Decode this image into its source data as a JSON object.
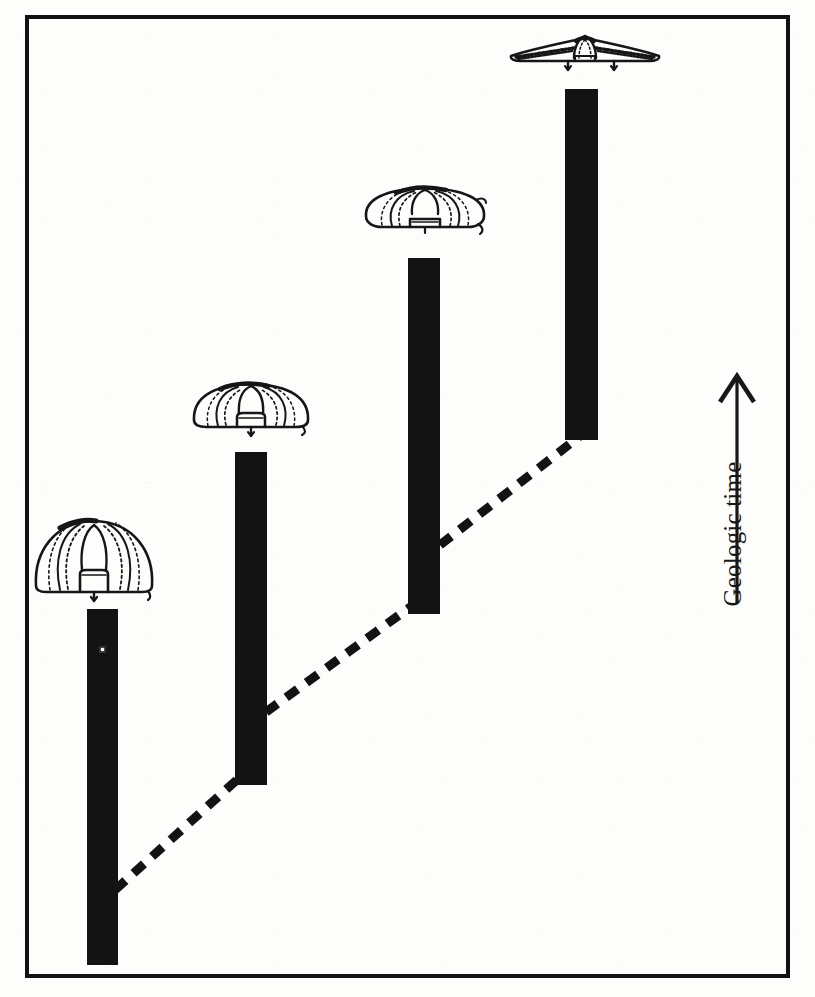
{
  "figure": {
    "domain_kind": "paleontology-range-chart",
    "caption_absent": true,
    "background_color": "#fdfdfb",
    "ink_color": "#131313",
    "frame": {
      "x": 25,
      "y": 15,
      "width": 765,
      "height": 963,
      "border_width": 4,
      "border_color": "#121212"
    }
  },
  "axis": {
    "time": {
      "label": "Geologic time",
      "direction": "upward",
      "arrow_icon": "up-arrow-icon",
      "orientation_degrees": -90,
      "x": 700,
      "y": 370
    }
  },
  "chart_data": {
    "type": "bar",
    "title": "",
    "subtitle": "",
    "xlabel": "",
    "ylabel": "Geologic time",
    "grid": false,
    "legend_position": "none",
    "orientation": "vertical",
    "axis_direction": "time increases upward",
    "categories": [
      "Taxon 1",
      "Taxon 2",
      "Taxon 3",
      "Taxon 4"
    ],
    "values": [
      356,
      333,
      356,
      351
    ],
    "bars": [
      {
        "index": 1,
        "name": "Taxon 1",
        "x": 87,
        "y": 609,
        "width": 31,
        "height": 356,
        "top_y": 609,
        "bottom_y": 965,
        "color": "#131313",
        "has_speck": true,
        "speck": {
          "x": 99,
          "y": 646,
          "shape": "white-ring"
        }
      },
      {
        "index": 2,
        "name": "Taxon 2",
        "x": 235,
        "y": 452,
        "width": 32,
        "height": 333,
        "top_y": 452,
        "bottom_y": 785,
        "color": "#131313",
        "has_speck": false
      },
      {
        "index": 3,
        "name": "Taxon 3",
        "x": 408,
        "y": 258,
        "width": 32,
        "height": 356,
        "top_y": 258,
        "bottom_y": 614,
        "color": "#131313",
        "has_speck": false
      },
      {
        "index": 4,
        "name": "Taxon 4",
        "x": 565,
        "y": 89,
        "width": 33,
        "height": 351,
        "top_y": 89,
        "bottom_y": 440,
        "color": "#131313",
        "has_speck": false
      }
    ],
    "lineage_line": {
      "style": "dashed",
      "dash_pattern": "14 11",
      "stroke_width": 9,
      "color": "#131313",
      "points": [
        {
          "x": 115,
          "y": 890
        },
        {
          "x": 250,
          "y": 768
        },
        {
          "x": 266,
          "y": 712
        },
        {
          "x": 424,
          "y": 597
        },
        {
          "x": 440,
          "y": 545
        },
        {
          "x": 580,
          "y": 436
        }
      ],
      "segments": [
        {
          "from": "bar-1-base",
          "to": "bar-2-base"
        },
        {
          "from": "bar-2-base",
          "to": "bar-3-base"
        },
        {
          "from": "bar-3-base",
          "to": "bar-4-base"
        }
      ]
    },
    "organisms": [
      {
        "index": 1,
        "label": "trilobite-cephalon-1",
        "shape": "tall domed, narrow, strongly vaulted cephalon with prominent glabella and short genal spines",
        "x": 30,
        "y": 512,
        "width": 128,
        "height": 92,
        "aspect": "tall-domed",
        "above_bar": 1
      },
      {
        "index": 2,
        "label": "trilobite-cephalon-2",
        "shape": "moderately flattened cephalon, wider than tall, glabella visible, genal spines slightly splayed",
        "x": 190,
        "y": 378,
        "width": 122,
        "height": 62,
        "aspect": "moderately-flattened",
        "above_bar": 2
      },
      {
        "index": 3,
        "label": "trilobite-cephalon-3",
        "shape": "broadly flattened low cephalon, much wider than tall, reduced vaulting, divergent genal spines",
        "x": 362,
        "y": 183,
        "width": 126,
        "height": 60,
        "aspect": "broadly-flattened",
        "above_bar": 3
      },
      {
        "index": 4,
        "label": "trilobite-cephalon-4",
        "shape": "extremely wide, nearly flat wing-like cephalon with long lateral extensions and downward genal spines",
        "x": 506,
        "y": 32,
        "width": 158,
        "height": 40,
        "aspect": "extremely-wide-flat",
        "above_bar": 4
      }
    ],
    "trend": "Cephalon outline becomes progressively wider and flatter upward through geologic time while stratigraphic range bars step higher."
  }
}
